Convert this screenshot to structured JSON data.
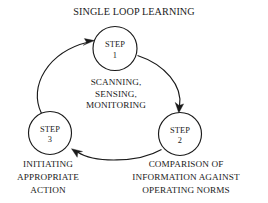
{
  "diagram": {
    "title": "SINGLE LOOP LEARNING",
    "center_caption": {
      "line1": "SCANNING,",
      "line2": "SENSING,",
      "line3": "MONITORING"
    },
    "nodes": [
      {
        "id": "step-1",
        "label_line1": "STEP",
        "label_line2": "1"
      },
      {
        "id": "step-2",
        "label_line1": "STEP",
        "label_line2": "2"
      },
      {
        "id": "step-3",
        "label_line1": "STEP",
        "label_line2": "3"
      }
    ],
    "captions": {
      "step3_caption": {
        "line1": "INITIATING",
        "line2": "APPROPRIATE",
        "line3": "ACTION"
      },
      "step2_caption": {
        "line1": "COMPARISON OF",
        "line2": "INFORMATION AGAINST",
        "line3": "OPERATING NORMS"
      }
    },
    "colors": {
      "ink": "#1a1a1a",
      "background": "#ffffff"
    }
  }
}
